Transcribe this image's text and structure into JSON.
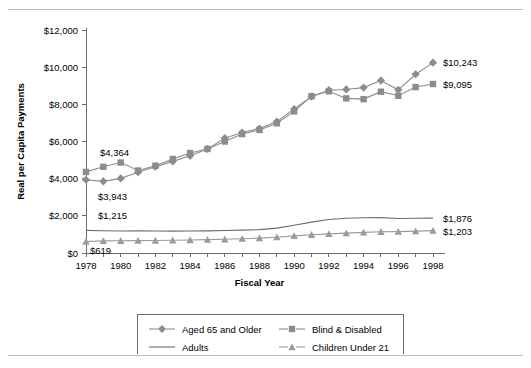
{
  "chart_data": {
    "type": "line",
    "title": "",
    "xlabel": "Fiscal Year",
    "ylabel": "Real per Capita Payments",
    "xlim": [
      1978,
      1998
    ],
    "ylim": [
      0,
      12000
    ],
    "ytick_step": 2000,
    "grid": false,
    "legend_position": "bottom",
    "x": [
      1978,
      1979,
      1980,
      1981,
      1982,
      1983,
      1984,
      1985,
      1986,
      1987,
      1988,
      1989,
      1990,
      1991,
      1992,
      1993,
      1994,
      1995,
      1996,
      1997,
      1998
    ],
    "xtick_labels": [
      "1978",
      "",
      "1980",
      "",
      "1982",
      "",
      "1984",
      "",
      "1986",
      "",
      "1988",
      "",
      "1990",
      "",
      "1992",
      "",
      "1994",
      "",
      "1996",
      "",
      "1998"
    ],
    "ytick_labels": [
      "$0",
      "$2,000",
      "$4,000",
      "$6,000",
      "$8,000",
      "$10,000",
      "$12,000"
    ],
    "series": [
      {
        "name": "Aged 65 and Older",
        "marker": "diamond",
        "color": "#8c8c8c",
        "values": [
          3943,
          3855,
          4015,
          4345,
          4640,
          4930,
          5230,
          5600,
          6180,
          6480,
          6700,
          7070,
          7750,
          8420,
          8760,
          8800,
          8900,
          9280,
          8780,
          9620,
          10243
        ]
      },
      {
        "name": "Blind & Disabled",
        "marker": "square",
        "color": "#8c8c8c",
        "values": [
          4364,
          4640,
          4870,
          4440,
          4700,
          5060,
          5380,
          5600,
          6000,
          6400,
          6620,
          6980,
          7620,
          8440,
          8700,
          8320,
          8280,
          8680,
          8460,
          8930,
          9095
        ]
      },
      {
        "name": "Adults",
        "marker": "none",
        "color": "#6d6d6d",
        "values": [
          1215,
          1195,
          1185,
          1190,
          1185,
          1175,
          1180,
          1190,
          1210,
          1230,
          1260,
          1340,
          1490,
          1660,
          1800,
          1870,
          1900,
          1905,
          1860,
          1870,
          1876
        ]
      },
      {
        "name": "Children Under 21",
        "marker": "triangle",
        "color": "#9b9b9b",
        "values": [
          619,
          650,
          660,
          665,
          672,
          685,
          700,
          718,
          740,
          770,
          800,
          850,
          920,
          980,
          1030,
          1070,
          1110,
          1140,
          1150,
          1175,
          1203
        ]
      }
    ],
    "annotations": [
      {
        "text": "$4,364",
        "x": 1978,
        "y": 4364,
        "dx": 14,
        "dy": -16,
        "name": "annotation-blind-start"
      },
      {
        "text": "$3,943",
        "x": 1978,
        "y": 3943,
        "dx": 12,
        "dy": 20,
        "name": "annotation-aged-start"
      },
      {
        "text": "$1,215",
        "x": 1978,
        "y": 1215,
        "dx": 12,
        "dy": -11,
        "name": "annotation-adults-start"
      },
      {
        "text": "$619",
        "x": 1978,
        "y": 619,
        "dx": 4,
        "dy": 13,
        "name": "annotation-children-start"
      },
      {
        "text": "$10,243",
        "x": 1998,
        "y": 10243,
        "dx": 10,
        "dy": 3,
        "name": "annotation-aged-end"
      },
      {
        "text": "$9,095",
        "x": 1998,
        "y": 9095,
        "dx": 10,
        "dy": 4,
        "name": "annotation-blind-end"
      },
      {
        "text": "$1,876",
        "x": 1998,
        "y": 1876,
        "dx": 10,
        "dy": 4,
        "name": "annotation-adults-end"
      },
      {
        "text": "$1,203",
        "x": 1998,
        "y": 1203,
        "dx": 10,
        "dy": 4,
        "name": "annotation-children-end"
      }
    ]
  },
  "legend": {
    "entries": [
      {
        "label": "Aged 65 and Older",
        "marker": "diamond",
        "color": "#8c8c8c"
      },
      {
        "label": "Blind & Disabled",
        "marker": "square",
        "color": "#8c8c8c"
      },
      {
        "label": "Adults",
        "marker": "none",
        "color": "#6d6d6d"
      },
      {
        "label": "Children Under 21",
        "marker": "triangle",
        "color": "#9b9b9b"
      }
    ]
  }
}
